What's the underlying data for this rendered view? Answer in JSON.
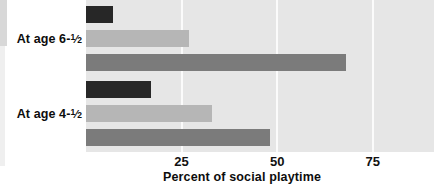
{
  "chart_data": {
    "type": "bar",
    "orientation": "horizontal",
    "title": "",
    "subtitle": "",
    "xlabel": "Percent of social playtime",
    "ylabel": "",
    "categories": [
      "At age 6-½",
      "At age 4-½"
    ],
    "category_labels_parts": [
      {
        "text": "At age 6-",
        "numerator": "1",
        "denominator": "2"
      },
      {
        "text": "At age 4-",
        "numerator": "1",
        "denominator": "2"
      }
    ],
    "series": [
      {
        "name": "series-1",
        "color": "#272727",
        "values": [
          7,
          17
        ]
      },
      {
        "name": "series-2",
        "color": "#b6b6b6",
        "values": [
          27,
          33
        ]
      },
      {
        "name": "series-3",
        "color": "#7b7b7b",
        "values": [
          68,
          48
        ]
      }
    ],
    "xticks": [
      25,
      50,
      75
    ],
    "xtick_labels": [
      "25",
      "50",
      "75"
    ],
    "xlim": [
      0,
      91
    ],
    "grid": true,
    "grid_color": "#fbfbfb",
    "plot_background": "#e6e6e6",
    "legend": "none",
    "legend_position": "none"
  },
  "colors": {
    "plot_background": "#e6e6e6",
    "gridline": "#fbfbfb",
    "bar_dark": "#272727",
    "bar_light": "#b6b6b6",
    "bar_medium": "#7b7b7b",
    "text": "#0d0d0d",
    "page_background": "#ffffff"
  }
}
